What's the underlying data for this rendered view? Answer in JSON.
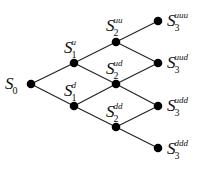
{
  "diagram": {
    "colors": {
      "line": "#222222",
      "node": "#000000",
      "text": "#111111"
    },
    "nodes": [
      {
        "id": "S0",
        "base": "S",
        "sub": "0",
        "sup": "",
        "x": 31,
        "y": 84,
        "lx": 5,
        "ly": 75
      },
      {
        "id": "S1u",
        "base": "S",
        "sub": "1",
        "sup": "u",
        "x": 74,
        "y": 63,
        "lx": 64,
        "ly": 39
      },
      {
        "id": "S1d",
        "base": "S",
        "sub": "1",
        "sup": "d",
        "x": 74,
        "y": 106,
        "lx": 64,
        "ly": 82
      },
      {
        "id": "S2uu",
        "base": "S",
        "sub": "2",
        "sup": "uu",
        "x": 116,
        "y": 42,
        "lx": 106,
        "ly": 17
      },
      {
        "id": "S2ud",
        "base": "S",
        "sub": "2",
        "sup": "ud",
        "x": 116,
        "y": 84,
        "lx": 106,
        "ly": 60
      },
      {
        "id": "S2dd",
        "base": "S",
        "sub": "2",
        "sup": "dd",
        "x": 116,
        "y": 127,
        "lx": 106,
        "ly": 103
      },
      {
        "id": "S3uuu",
        "base": "S",
        "sub": "3",
        "sup": "uuu",
        "x": 158,
        "y": 21,
        "lx": 167,
        "ly": 12
      },
      {
        "id": "S3uud",
        "base": "S",
        "sub": "3",
        "sup": "uud",
        "x": 158,
        "y": 63,
        "lx": 167,
        "ly": 54
      },
      {
        "id": "S3udd",
        "base": "S",
        "sub": "3",
        "sup": "udd",
        "x": 158,
        "y": 106,
        "lx": 167,
        "ly": 97
      },
      {
        "id": "S3ddd",
        "base": "S",
        "sub": "3",
        "sup": "ddd",
        "x": 158,
        "y": 148,
        "lx": 167,
        "ly": 140
      }
    ],
    "edges": [
      [
        "S0",
        "S1u"
      ],
      [
        "S0",
        "S1d"
      ],
      [
        "S1u",
        "S2uu"
      ],
      [
        "S1u",
        "S2ud"
      ],
      [
        "S1d",
        "S2ud"
      ],
      [
        "S1d",
        "S2dd"
      ],
      [
        "S2uu",
        "S3uuu"
      ],
      [
        "S2uu",
        "S3uud"
      ],
      [
        "S2ud",
        "S3uud"
      ],
      [
        "S2ud",
        "S3udd"
      ],
      [
        "S2dd",
        "S3udd"
      ],
      [
        "S2dd",
        "S3ddd"
      ]
    ]
  }
}
